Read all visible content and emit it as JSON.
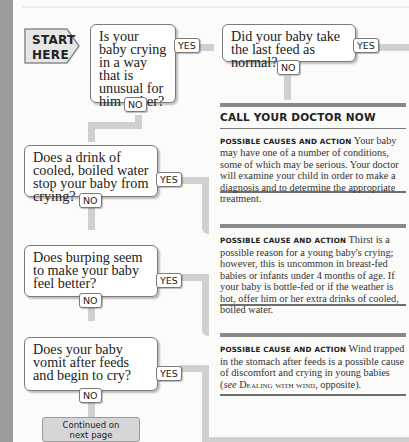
{
  "start_label": {
    "line1": "START",
    "line2": "HERE"
  },
  "questions": [
    {
      "text": "Is your baby crying in a way that is unusual for him or her?",
      "yes": "YES",
      "no": "NO"
    },
    {
      "text": "Did your baby take the last feed as normal?",
      "yes": "YES",
      "no": "NO"
    },
    {
      "text": "Does a drink of cooled, boiled water stop your baby from crying?",
      "yes": "YES",
      "no": "NO"
    },
    {
      "text": "Does burping seem to make your baby feel better?",
      "yes": "YES",
      "no": "NO"
    },
    {
      "text": "Does your baby vomit after feeds and begin to cry?",
      "yes": "YES",
      "no": "NO"
    }
  ],
  "panels": [
    {
      "heading": "CALL YOUR DOCTOR NOW",
      "label": "Possible causes and action",
      "body": "Your baby may have one of a number of conditions, some of which may be serious. Your doctor will examine your child in order to make a diagnosis and to determine the appropriate treatment."
    },
    {
      "label": "Possible cause and action",
      "body": "Thirst is a possible reason for a young baby's crying; however, this is uncommon in breast-fed babies or infants under 4 months of age. If your baby is bottle-fed or if the weather is hot, offer him or her extra drinks of cooled, boiled water."
    },
    {
      "label": "Possible cause and action",
      "body_pre": "Wind trapped in the stomach after feeds is a possible cause of discomfort and crying in young babies (",
      "see": "see",
      "ref": "Dealing with wind",
      "body_post": ", opposite)."
    }
  ],
  "continued": {
    "line1": "Continued on",
    "line2": "next page"
  },
  "colors": {
    "stripe": "#9b9b9b",
    "connector": "#d0d0d0",
    "box_border": "#7a7a7a",
    "rule": "#8a8a8a"
  }
}
